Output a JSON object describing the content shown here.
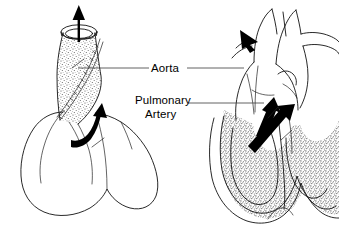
{
  "figure": {
    "background_color": "#ffffff",
    "line_color": "#111111",
    "arrow_color": "#000000",
    "leader_color": "#3a3a3a",
    "stipple_color": "#555555"
  },
  "labels": {
    "aorta": "Aorta",
    "pulmonary_line1": "Pulmonary",
    "pulmonary_line2": "Artery"
  },
  "panels": {
    "left": {
      "name": "exterior-heart-view",
      "description": "Exterior view of heart with cut-open great vessel",
      "arrows": [
        {
          "name": "upward-outflow-arrow",
          "direction": "up"
        },
        {
          "name": "curved-flow-arrow",
          "direction": "up-right"
        }
      ]
    },
    "right": {
      "name": "cross-section-heart-view",
      "description": "Cross-sectional view of heart showing ventricle walls and aortic arch",
      "arrows": [
        {
          "name": "aortic-arch-arrow",
          "direction": "up-left"
        },
        {
          "name": "left-ventricle-outflow-arrow",
          "direction": "up"
        },
        {
          "name": "pulmonary-outflow-arrow",
          "direction": "up-right"
        }
      ]
    }
  }
}
